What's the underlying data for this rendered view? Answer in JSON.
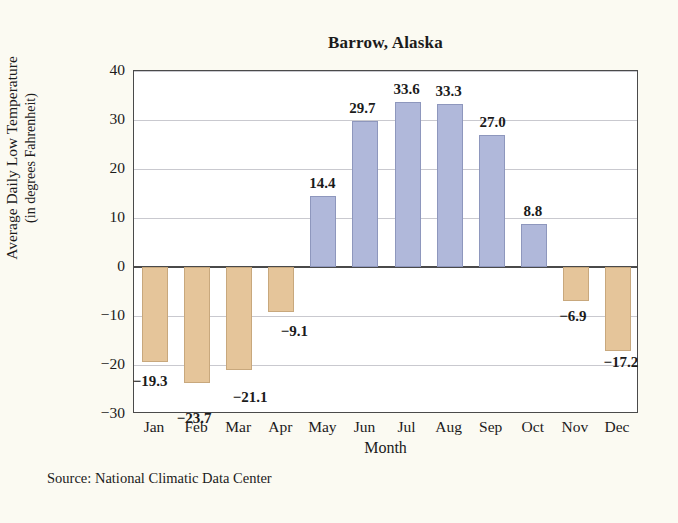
{
  "chart_data": {
    "type": "bar",
    "title": "Barrow, Alaska",
    "xlabel": "Month",
    "ylabel_line1": "Average Daily Low Temperature",
    "ylabel_line2": "(in degrees Fahrenheit)",
    "categories": [
      "Jan",
      "Feb",
      "Mar",
      "Apr",
      "May",
      "Jun",
      "Jul",
      "Aug",
      "Sep",
      "Oct",
      "Nov",
      "Dec"
    ],
    "values": [
      -19.3,
      -23.7,
      -21.1,
      -9.1,
      14.4,
      29.7,
      33.6,
      33.3,
      27.0,
      8.8,
      -6.9,
      -17.2
    ],
    "value_labels": [
      "−19.3",
      "−23.7",
      "−21.1",
      "−9.1",
      "14.4",
      "29.7",
      "33.6",
      "33.3",
      "27.0",
      "8.8",
      "−6.9",
      "−17.2"
    ],
    "ylim": [
      -30,
      40
    ],
    "yticks": [
      40,
      30,
      20,
      10,
      0,
      -10,
      -20,
      -30
    ],
    "ytick_labels": [
      "40",
      "30",
      "20",
      "10",
      "0",
      "−10",
      "−20",
      "−30"
    ],
    "grid": true,
    "legend": "none",
    "colors": {
      "positive_bar": "#b0b8da",
      "negative_bar": "#e5c59a",
      "positive_bar_edge": "#8e97bd",
      "negative_bar_edge": "#c8a87d",
      "gridline": "#c9c9cf",
      "axis": "#4a4a4a",
      "plot_background": "#ffffff",
      "page_background": "#fbfaf2",
      "text": "#1b1b1b"
    }
  },
  "source": {
    "note": "Source: National Climatic Data Center"
  }
}
